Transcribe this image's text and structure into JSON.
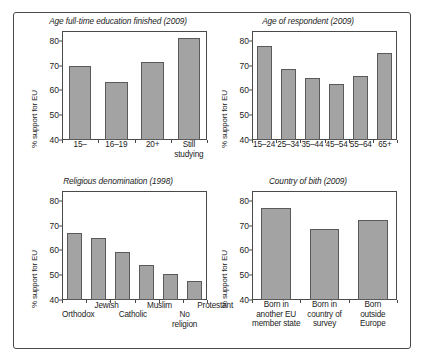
{
  "figure": {
    "y_axis_label": "% support for EU",
    "y_ticks": [
      "40",
      "50",
      "60",
      "70",
      "80"
    ]
  },
  "chart_data": [
    {
      "id": "education",
      "type": "bar",
      "title": "Age full-time education finished (2009)",
      "xlabel": "",
      "ylabel": "% support for EU",
      "ylim": [
        40,
        84
      ],
      "yticks": [
        40,
        50,
        60,
        70,
        80
      ],
      "grid": false,
      "legend": "none",
      "categories": [
        "15–",
        "16–19",
        "20+",
        "Still studying"
      ],
      "values": [
        70,
        63.5,
        71.5,
        81
      ]
    },
    {
      "id": "age",
      "type": "bar",
      "title": "Age of respondent (2009)",
      "xlabel": "",
      "ylabel": "% support for EU",
      "ylim": [
        40,
        84
      ],
      "yticks": [
        40,
        50,
        60,
        70,
        80
      ],
      "grid": false,
      "legend": "none",
      "categories": [
        "15–24",
        "25–34",
        "35–44",
        "45–54",
        "55–64",
        "65+"
      ],
      "values": [
        78,
        68.5,
        65,
        62.5,
        66,
        75
      ]
    },
    {
      "id": "religion",
      "type": "bar",
      "title": "Religious denomination (1998)",
      "xlabel": "",
      "ylabel": "% support for EU",
      "ylim": [
        40,
        84
      ],
      "yticks": [
        40,
        50,
        60,
        70,
        80
      ],
      "grid": false,
      "legend": "none",
      "categories": [
        "Orthodox",
        "Jewish",
        "Catholic",
        "Muslim",
        "No religion",
        "Protestant"
      ],
      "values": [
        67,
        65,
        59.5,
        54,
        50.5,
        47.5
      ]
    },
    {
      "id": "country-of-birth",
      "type": "bar",
      "title": "Country of bith (2009)",
      "xlabel": "",
      "ylabel": "% support for EU",
      "ylim": [
        40,
        84
      ],
      "yticks": [
        40,
        50,
        60,
        70,
        80
      ],
      "grid": false,
      "legend": "none",
      "categories": [
        "Born in\nanother EU\nmember state",
        "Born in\ncountry of\nsurvey",
        "Born\noutside\nEurope"
      ],
      "values": [
        77,
        68.5,
        72.5
      ]
    }
  ],
  "colors": {
    "bar_fill": "#a3a3a3",
    "bar_stroke": "#5a5a5a",
    "axis": "#4a4a4a",
    "text": "#1c1c1c",
    "background": "#ffffff"
  }
}
